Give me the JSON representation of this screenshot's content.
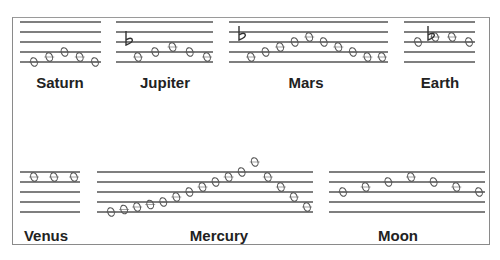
{
  "staves": [
    {
      "name": "Saturn",
      "notes": [
        0,
        1,
        2,
        1,
        0
      ],
      "flat_step": null,
      "flat_before_index": null
    },
    {
      "name": "Jupiter",
      "notes": [
        1,
        2,
        3,
        2,
        1
      ],
      "flat_step": 4,
      "flat_before_index": 0
    },
    {
      "name": "Mars",
      "notes": [
        1,
        2,
        3,
        4,
        5,
        4,
        3,
        2,
        1,
        1
      ],
      "flat_step": 5,
      "flat_before_index": 0
    },
    {
      "name": "Earth",
      "notes": [
        4,
        5,
        5,
        4
      ],
      "flat_step": 5,
      "flat_before_index": 1
    },
    {
      "name": "Venus",
      "notes": [
        7,
        7,
        7
      ],
      "flat_step": null,
      "flat_before_index": null
    },
    {
      "name": "Mercury",
      "notes": [
        0,
        0.5,
        1,
        1.5,
        2,
        3,
        4,
        5,
        6,
        7,
        8,
        10,
        7,
        5,
        3,
        1
      ],
      "flat_step": null,
      "flat_before_index": null
    },
    {
      "name": "Moon",
      "notes": [
        4,
        5,
        6,
        7,
        6,
        5,
        4
      ],
      "flat_step": null,
      "flat_before_index": null
    }
  ]
}
